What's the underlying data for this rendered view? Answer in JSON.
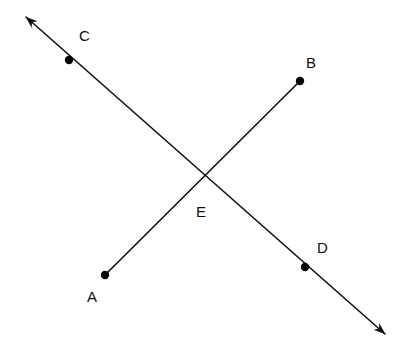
{
  "figure": {
    "kind": "geometry-diagram",
    "width": 403,
    "height": 355,
    "background_color": "#ffffff",
    "stroke_color": "#101010",
    "stroke_width": 1.6,
    "point_marker_color": "#000000",
    "point_marker_size": 4.2,
    "label_color": "#101010",
    "label_font_size": 15
  },
  "points": [
    {
      "id": "A",
      "label": "A",
      "x": 105,
      "y": 275,
      "marker": true,
      "label_x": 87,
      "label_y": 289
    },
    {
      "id": "B",
      "label": "B",
      "x": 300,
      "y": 81,
      "marker": true,
      "label_x": 306,
      "label_y": 55
    },
    {
      "id": "C",
      "label": "C",
      "x": 69,
      "y": 60,
      "marker": true,
      "label_x": 79,
      "label_y": 28
    },
    {
      "id": "D",
      "label": "D",
      "x": 305,
      "y": 267,
      "marker": true,
      "label_x": 317,
      "label_y": 240
    },
    {
      "id": "E",
      "label": "E",
      "x": 201,
      "y": 178,
      "marker": false,
      "label_x": 196,
      "label_y": 204
    }
  ],
  "lines": [
    {
      "id": "line-CD",
      "name": "double-arrow-line-through-C-E-D",
      "from_x": 26,
      "from_y": 17,
      "to_x": 385,
      "to_y": 334,
      "arrow_start": true,
      "arrow_end": true,
      "passes_through": [
        "C",
        "E",
        "D"
      ]
    },
    {
      "id": "segment-AB",
      "name": "segment-A-to-B",
      "from_x": 105,
      "from_y": 275,
      "to_x": 300,
      "to_y": 81,
      "arrow_start": false,
      "arrow_end": false,
      "passes_through": [
        "A",
        "E",
        "B"
      ]
    }
  ]
}
